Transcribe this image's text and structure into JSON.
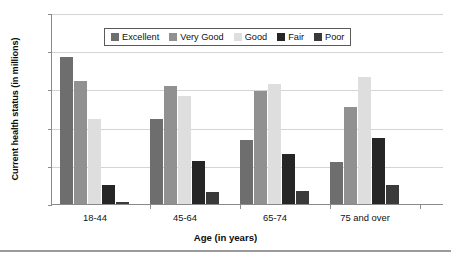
{
  "chart_data": {
    "type": "bar",
    "title": "",
    "xlabel": "Age (in years)",
    "ylabel": "Current health status (in millions)",
    "categories": [
      "18-44",
      "45-64",
      "65-74",
      "75 and over"
    ],
    "series": [
      {
        "name": "Excellent",
        "color": "#6e6e6e",
        "values": [
          38.5,
          22.3,
          16.7,
          11.1
        ]
      },
      {
        "name": "Very Good",
        "color": "#919191",
        "values": [
          32.3,
          31.0,
          29.5,
          25.3
        ]
      },
      {
        "name": "Good",
        "color": "#dedede",
        "values": [
          22.2,
          28.4,
          31.3,
          33.2
        ]
      },
      {
        "name": "Fair",
        "color": "#262626",
        "values": [
          4.9,
          11.2,
          13.0,
          17.4
        ]
      },
      {
        "name": "Poor",
        "color": "#3a3a3a",
        "values": [
          0.6,
          3.1,
          3.4,
          5.1
        ]
      }
    ],
    "ylim": [
      0,
      50
    ],
    "yticks": [
      0,
      10,
      20,
      30,
      40,
      50
    ],
    "ytick_labels": [
      "0",
      "10",
      "20",
      "30",
      "40",
      "50"
    ],
    "grid": true,
    "legend_position": "top-center",
    "axis_color": "#8a8a8a",
    "grid_color": "#d4d4d4"
  }
}
